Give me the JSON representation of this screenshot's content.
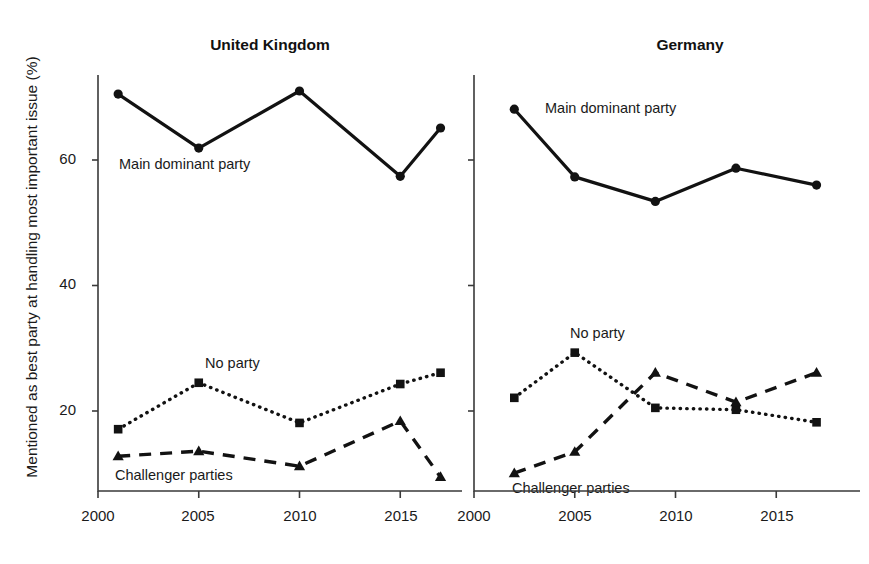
{
  "figure": {
    "ylabel": "Mentioned as best party at handling most important issue (%)",
    "accent_color": "#121212",
    "axis_color": "#3a3a3a"
  },
  "panels": [
    {
      "title": "United Kingdom",
      "xticks": [
        "2000",
        "2005",
        "2010",
        "2015"
      ],
      "annotations": [
        {
          "name": "main-dominant-party",
          "text": "Main dominant party"
        },
        {
          "name": "no-party",
          "text": "No party"
        },
        {
          "name": "challenger-parties",
          "text": "Challenger parties"
        }
      ]
    },
    {
      "title": "Germany",
      "xticks": [
        "2000",
        "2005",
        "2010",
        "2015"
      ],
      "annotations": [
        {
          "name": "main-dominant-party",
          "text": "Main dominant party"
        },
        {
          "name": "no-party",
          "text": "No party"
        },
        {
          "name": "challenger-parties",
          "text": "Challenger parties"
        }
      ]
    }
  ],
  "yticks": [
    "60",
    "40",
    "20"
  ],
  "chart_data": {
    "type": "line",
    "title": "",
    "xlabel": "",
    "ylabel": "Mentioned as best party at handling most important issue (%)",
    "ylim": [
      6,
      75
    ],
    "ytick_values": [
      20,
      40,
      60
    ],
    "grid": false,
    "legend": "inline-annotations",
    "panels": [
      {
        "name": "United Kingdom",
        "xlim": [
          2000,
          2018
        ],
        "xtick_values": [
          2000,
          2005,
          2010,
          2015
        ],
        "series": [
          {
            "name": "Main dominant party",
            "marker": "circle",
            "linestyle": "solid",
            "x": [
              2001,
              2005,
              2010,
              2015,
              2017
            ],
            "values": [
              70.5,
              61.9,
              71.0,
              57.4,
              65.1
            ]
          },
          {
            "name": "No party",
            "marker": "square",
            "linestyle": "dotted",
            "x": [
              2001,
              2005,
              2010,
              2015,
              2017
            ],
            "values": [
              17.1,
              24.5,
              18.1,
              24.3,
              26.1
            ]
          },
          {
            "name": "Challenger parties",
            "marker": "triangle",
            "linestyle": "dashed",
            "x": [
              2001,
              2005,
              2010,
              2015,
              2017
            ],
            "values": [
              12.8,
              13.6,
              11.2,
              18.4,
              9.5
            ]
          }
        ]
      },
      {
        "name": "Germany",
        "xlim": [
          2000,
          2018
        ],
        "xtick_values": [
          2000,
          2005,
          2010,
          2015
        ],
        "series": [
          {
            "name": "Main dominant party",
            "marker": "circle",
            "linestyle": "solid",
            "x": [
              2002,
              2005,
              2009,
              2013,
              2017
            ],
            "values": [
              68.1,
              57.3,
              53.4,
              58.7,
              56.0
            ]
          },
          {
            "name": "No party",
            "marker": "square",
            "linestyle": "dotted",
            "x": [
              2002,
              2005,
              2009,
              2013,
              2017
            ],
            "values": [
              22.1,
              29.3,
              20.5,
              20.2,
              18.2
            ]
          },
          {
            "name": "Challenger parties",
            "marker": "triangle",
            "linestyle": "dashed",
            "x": [
              2002,
              2005,
              2009,
              2013,
              2017
            ],
            "values": [
              10.1,
              13.5,
              26.1,
              21.4,
              26.1
            ]
          }
        ]
      }
    ]
  }
}
